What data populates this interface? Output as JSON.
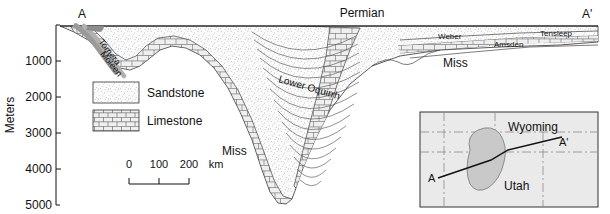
{
  "figure": {
    "type": "geologic-cross-section",
    "transect_start": "A",
    "transect_end": "A'"
  },
  "axis": {
    "title": "Meters",
    "ticks": [
      "",
      "1000",
      "2000",
      "3000",
      "4000",
      "5000"
    ],
    "tick_values": [
      0,
      1000,
      2000,
      3000,
      4000,
      5000
    ],
    "range_top": 0,
    "range_bottom": 5000
  },
  "section_labels": {
    "permian": "Permian",
    "tomera": "Tomera",
    "moleen": "Moleen",
    "lower_oquirrh": "Lower Oquirrh",
    "miss_right": "Miss",
    "miss_lower": "Miss",
    "weber": "Weber",
    "amsden": "Amsden",
    "tensleep": "Tensleep"
  },
  "legend": {
    "items": [
      {
        "label": "Sandstone",
        "pattern": "stipple"
      },
      {
        "label": "Limestone",
        "pattern": "brick"
      }
    ]
  },
  "scalebar": {
    "ticks": [
      "0",
      "100",
      "200"
    ],
    "unit": "km"
  },
  "inset": {
    "states": [
      "Wyoming",
      "Utah"
    ],
    "line_start": "A",
    "line_end": "A'"
  },
  "colors": {
    "ink": "#111111",
    "sandstone_fill": "#f2f2f2",
    "limestone_fill": "#ececec",
    "dark_band": "#9a9a9a",
    "inset_bg": "#eaeaea",
    "inset_blob": "#c9c9c9"
  }
}
